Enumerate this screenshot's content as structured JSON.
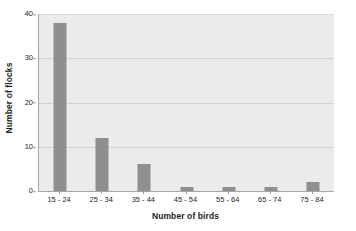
{
  "chart_data": {
    "type": "bar",
    "title": "",
    "subtitle": "",
    "xlabel": "Number of birds",
    "ylabel": "Number of flocks",
    "categories": [
      "15 - 24",
      "25 - 34",
      "35 - 44",
      "45 - 54",
      "55 - 64",
      "65 - 74",
      "75 - 84"
    ],
    "values": [
      38,
      12,
      6,
      1,
      1,
      1,
      2
    ],
    "series": [
      {
        "name": "Number of flocks",
        "values": [
          38,
          12,
          6,
          1,
          1,
          1,
          2
        ]
      }
    ],
    "ylim": [
      0,
      40
    ],
    "yticks": [
      0,
      10,
      20,
      30,
      40
    ],
    "ytick_labels": [
      "0",
      "10",
      "20",
      "30",
      "40"
    ],
    "grid": "horizontal",
    "legend": "none",
    "bar_color": "#8f8f8f",
    "plot_background": "#ebebeb",
    "gridline_color": "#d2d2d2",
    "axis_color": "#a6a6a6",
    "text_color": "#231f20",
    "canvas_background": "#ffffff"
  }
}
